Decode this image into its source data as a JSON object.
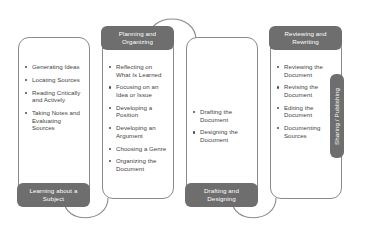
{
  "diagram": {
    "accent_color": "#6e6e6e",
    "outline_color": "#8a8a8a",
    "text_color": "#3f3f3f",
    "columns": [
      {
        "badge": {
          "line1": "Learning about a",
          "line2": "Subject",
          "position": "bottom"
        },
        "items": [
          "Generating Ideas",
          "Locating Sources",
          "Reading Critically and Actively",
          "Taking Notes and Evaluating Sources"
        ]
      },
      {
        "badge": {
          "line1": "Planning and",
          "line2": "Organizing",
          "position": "top"
        },
        "items": [
          "Reflecting on What Is Learned",
          "Focusing on an Idea or Issue",
          "Developing a Position",
          "Developing an Argument",
          "Choosing a Genre",
          "Organizing the Document"
        ]
      },
      {
        "badge": {
          "line1": "Drafting and",
          "line2": "Designing",
          "position": "bottom"
        },
        "items": [
          "Drafting the Document",
          "Designing the Document"
        ]
      },
      {
        "badge": {
          "line1": "Reviewing and",
          "line2": "Rewriting",
          "position": "top"
        },
        "items": [
          "Reviewing the Document",
          "Revising the Document",
          "Editing the Document",
          "Documenting Sources"
        ]
      }
    ],
    "side_badge": {
      "label": "Sharing / Publishing"
    }
  }
}
